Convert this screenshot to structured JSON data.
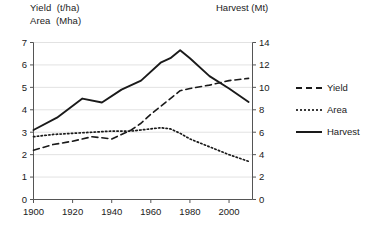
{
  "axis_titles": {
    "left_line1": "Yield  (t/ha)",
    "left_line2": "Area  (Mha)",
    "right": "Harvest (Mt)"
  },
  "legend": {
    "position": "right",
    "items": [
      {
        "label": "Yield",
        "style": "dashed",
        "key": "yield-legend-key"
      },
      {
        "label": "Area",
        "style": "dotted",
        "key": "area-legend-key"
      },
      {
        "label": "Harvest",
        "style": "solid",
        "key": "harvest-legend-key"
      }
    ]
  },
  "left_axis": {
    "ticks": [
      "0",
      "1",
      "2",
      "3",
      "4",
      "5",
      "6",
      "7"
    ],
    "min": 0,
    "max": 7
  },
  "right_axis": {
    "ticks": [
      "0",
      "2",
      "4",
      "6",
      "8",
      "10",
      "12",
      "14"
    ],
    "min": 0,
    "max": 14
  },
  "x_axis": {
    "ticks": [
      "1900",
      "1920",
      "1940",
      "1960",
      "1980",
      "2000"
    ],
    "min": 1900,
    "max": 2012
  },
  "colors": {
    "line": "#1a1a1a",
    "grid": "#e2e2e2",
    "axis": "#555555",
    "background": "#ffffff"
  },
  "chart_data": {
    "type": "line",
    "title": "",
    "subtitle": "",
    "xlabel": "",
    "ylabel": "Yield (t/ha) / Area (Mha)",
    "y2label": "Harvest (Mt)",
    "xlim": [
      1900,
      2012
    ],
    "ylim": [
      0,
      7
    ],
    "y2lim": [
      0,
      14
    ],
    "grid": true,
    "legend_position": "right",
    "xticks": [
      1900,
      1920,
      1940,
      1960,
      1980,
      2000
    ],
    "yticks": [
      0,
      1,
      2,
      3,
      4,
      5,
      6,
      7
    ],
    "y2ticks": [
      0,
      2,
      4,
      6,
      8,
      10,
      12,
      14
    ],
    "series": [
      {
        "name": "Yield",
        "style": "dashed",
        "axis": "left",
        "unit": "t/ha",
        "x": [
          1900,
          1910,
          1920,
          1930,
          1935,
          1940,
          1945,
          1950,
          1955,
          1960,
          1965,
          1970,
          1975,
          1980,
          1990,
          2000,
          2010
        ],
        "values": [
          2.2,
          2.45,
          2.6,
          2.8,
          2.75,
          2.7,
          2.9,
          3.1,
          3.4,
          3.8,
          4.15,
          4.5,
          4.85,
          4.95,
          5.1,
          5.3,
          5.4
        ]
      },
      {
        "name": "Area",
        "style": "dotted",
        "axis": "left",
        "unit": "Mha",
        "x": [
          1900,
          1910,
          1920,
          1930,
          1940,
          1950,
          1955,
          1960,
          1965,
          1970,
          1975,
          1980,
          1990,
          2000,
          2010
        ],
        "values": [
          2.8,
          2.9,
          2.95,
          3.0,
          3.05,
          3.05,
          3.1,
          3.15,
          3.2,
          3.15,
          2.95,
          2.7,
          2.35,
          2.0,
          1.7
        ]
      },
      {
        "name": "Harvest",
        "style": "solid",
        "axis": "right",
        "unit": "Mt",
        "x": [
          1900,
          1912,
          1925,
          1935,
          1945,
          1955,
          1965,
          1970,
          1975,
          1980,
          1990,
          2000,
          2010
        ],
        "values": [
          6.2,
          7.3,
          9.0,
          8.65,
          9.8,
          10.6,
          12.2,
          12.6,
          13.3,
          12.6,
          11.0,
          9.9,
          8.7
        ]
      }
    ]
  }
}
